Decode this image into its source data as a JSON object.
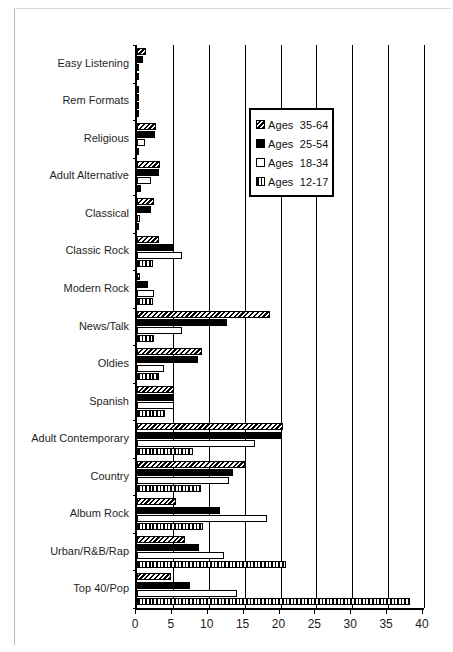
{
  "chart_data": {
    "type": "bar",
    "orientation": "horizontal",
    "title": "",
    "xlabel": "",
    "ylabel": "",
    "xlim": [
      0,
      40
    ],
    "xticks": [
      0,
      5,
      10,
      15,
      20,
      25,
      30,
      35,
      40
    ],
    "xtick_labels": [
      "0",
      "5",
      "10",
      "15",
      "20",
      "25",
      "30",
      "35",
      "40"
    ],
    "grid": "vertical",
    "legend_position": "upper-right-inside",
    "categories": [
      "Easy Listening",
      "Rem Formats",
      "Religious",
      "Adult  Alternative",
      "Classical",
      "Classic Rock",
      "Modern Rock",
      "News/Talk",
      "Oldies",
      "Spanish",
      "Adult  Contemporary",
      "Country",
      "Album Rock",
      "Urban/R&B/Rap",
      "Top  40/Pop"
    ],
    "series": [
      {
        "name": "Ages  35-64",
        "pattern": "diagonal-hatch",
        "values": [
          1.3,
          0.2,
          2.7,
          3.2,
          2.4,
          3.0,
          0.4,
          18.6,
          9.1,
          5.1,
          20.4,
          15.1,
          5.4,
          6.7,
          4.7
        ]
      },
      {
        "name": "Ages  25-54",
        "pattern": "solid-black",
        "values": [
          0.9,
          0.2,
          2.5,
          3.0,
          1.9,
          5.0,
          1.5,
          12.6,
          8.5,
          5.2,
          20.1,
          13.4,
          11.6,
          8.7,
          7.4
        ]
      },
      {
        "name": "Ages  18-34",
        "pattern": "open-white",
        "values": [
          0.3,
          0.2,
          1.1,
          2.0,
          0.4,
          6.3,
          2.3,
          6.3,
          3.7,
          5.1,
          16.4,
          12.8,
          18.1,
          12.1,
          13.9
        ]
      },
      {
        "name": "Ages  12-17",
        "pattern": "vertical-stripes",
        "values": [
          0.1,
          0.1,
          0.3,
          0.6,
          0.1,
          2.2,
          2.2,
          2.3,
          3.0,
          3.9,
          7.8,
          8.9,
          9.2,
          20.8,
          38.1
        ]
      }
    ]
  },
  "legend": {
    "items": [
      {
        "label": "Ages  35-64",
        "swatch": "diagonal-hatch-swatch"
      },
      {
        "label": "Ages  25-54",
        "swatch": "solid-black-swatch"
      },
      {
        "label": "Ages  18-34",
        "swatch": "open-white-swatch"
      },
      {
        "label": "Ages  12-17",
        "swatch": "vertical-stripes-swatch"
      }
    ]
  }
}
